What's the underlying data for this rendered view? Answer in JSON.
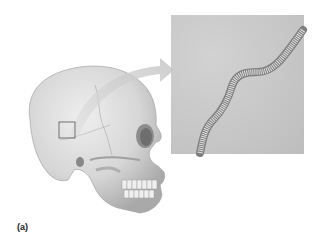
{
  "figure": {
    "panel_label": "(a)",
    "colors": {
      "background": "#ffffff",
      "bone": "#dcdcdc",
      "bone_shadow": "#a8a8a8",
      "inset_bg": "#c9c9c9",
      "suture": "#8a8a8a",
      "arrow": "#c8c8c8",
      "square_outline": "#555555"
    }
  }
}
